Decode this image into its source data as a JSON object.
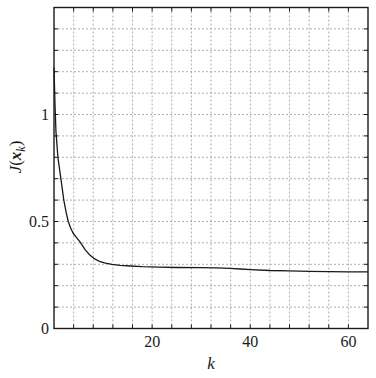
{
  "chart_data": {
    "type": "line",
    "title": "",
    "xlabel": "k",
    "ylabel": {
      "function": "J",
      "open_paren": "(",
      "variable": "x",
      "subscript": "k",
      "close_paren": ")"
    },
    "xlim": [
      0,
      64
    ],
    "ylim": [
      0,
      1.5
    ],
    "grid": true,
    "grid_style": "dashed",
    "x_grid_step": 4,
    "y_grid_step": 0.1,
    "x_tick_labels": [
      {
        "value": 20,
        "label": "20"
      },
      {
        "value": 40,
        "label": "40"
      },
      {
        "value": 60,
        "label": "60"
      }
    ],
    "y_tick_labels": [
      {
        "value": 0,
        "label": "0"
      },
      {
        "value": 0.5,
        "label": "0.5"
      },
      {
        "value": 1,
        "label": "1"
      }
    ],
    "legend": null,
    "series": [
      {
        "name": "J(x_k)",
        "color": "#1a1a1a",
        "x": [
          0,
          0.2,
          0.4,
          0.8,
          1.4,
          2.0,
          2.5,
          2.9,
          3.4,
          3.9,
          4.6,
          5.3,
          6.3,
          7.3,
          8.3,
          9.4,
          10.5,
          11.8,
          13.5,
          15.5,
          18,
          21.6,
          25,
          29.8,
          33,
          35.9,
          38,
          40,
          44,
          48,
          52,
          56,
          60,
          64
        ],
        "y": [
          1.22,
          1.05,
          0.92,
          0.8,
          0.7,
          0.6,
          0.54,
          0.5,
          0.47,
          0.445,
          0.425,
          0.405,
          0.37,
          0.343,
          0.325,
          0.312,
          0.305,
          0.3,
          0.295,
          0.292,
          0.289,
          0.287,
          0.285,
          0.284,
          0.283,
          0.281,
          0.278,
          0.275,
          0.271,
          0.269,
          0.267,
          0.266,
          0.265,
          0.265
        ]
      }
    ]
  },
  "style": {
    "axis_color": "#1a1a1a",
    "grid_color": "#9a9a9a",
    "background": "#ffffff"
  }
}
